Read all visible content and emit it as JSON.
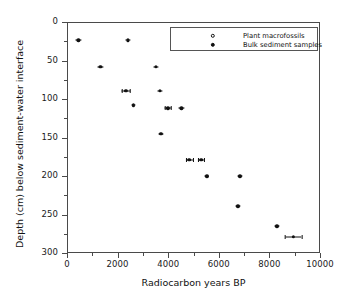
{
  "chart_data": {
    "type": "scatter",
    "title": "",
    "xlabel": "Radiocarbon years BP",
    "ylabel": "Depth (cm) below sediment-water interface",
    "xlim": [
      0,
      10000
    ],
    "ylim": [
      0,
      300
    ],
    "y_inverted": true,
    "grid": false,
    "legend_position": "top-right",
    "x_ticks": [
      0,
      2000,
      4000,
      6000,
      8000,
      10000
    ],
    "x_tick_labels": [
      "0",
      "2000",
      "4000",
      "6000",
      "8000",
      "10000"
    ],
    "x_minor_ticks": [
      1000,
      3000,
      5000,
      7000,
      9000
    ],
    "y_ticks": [
      0,
      50,
      100,
      150,
      200,
      250,
      300
    ],
    "y_tick_labels": [
      "0",
      "50",
      "100",
      "150",
      "200",
      "250",
      "300"
    ],
    "y_minor_ticks": [
      25,
      75,
      125,
      175,
      225,
      275
    ],
    "series": [
      {
        "name": "Plant macrofossils",
        "marker": "open-circle",
        "color": "#111111",
        "points": []
      },
      {
        "name": "Bulk sediment samples",
        "marker": "filled-circle",
        "color": "#111111",
        "points": [
          {
            "x": 450,
            "y": 24,
            "xerr": 110
          },
          {
            "x": 2400,
            "y": 24,
            "xerr": 110
          },
          {
            "x": 1320,
            "y": 58,
            "xerr": 110
          },
          {
            "x": 3520,
            "y": 58,
            "xerr": 110
          },
          {
            "x": 2320,
            "y": 89,
            "xerr": 170
          },
          {
            "x": 3680,
            "y": 89,
            "xerr": 110
          },
          {
            "x": 2620,
            "y": 108,
            "xerr": 90
          },
          {
            "x": 3980,
            "y": 112,
            "xerr": 130
          },
          {
            "x": 4520,
            "y": 112,
            "xerr": 110
          },
          {
            "x": 3720,
            "y": 145,
            "xerr": 90
          },
          {
            "x": 4840,
            "y": 179,
            "xerr": 120
          },
          {
            "x": 5300,
            "y": 179,
            "xerr": 120
          },
          {
            "x": 5520,
            "y": 200,
            "xerr": 90
          },
          {
            "x": 6840,
            "y": 200,
            "xerr": 90
          },
          {
            "x": 6760,
            "y": 239,
            "xerr": 90
          },
          {
            "x": 8300,
            "y": 265,
            "xerr": 90
          },
          {
            "x": 8950,
            "y": 279,
            "xerr": 330
          }
        ]
      }
    ]
  },
  "legend": {
    "entries": [
      {
        "label": "Plant macrofossils",
        "marker": "open-circle"
      },
      {
        "label": "Bulk sediment samples",
        "marker": "filled-circle"
      }
    ]
  },
  "axes": {
    "x_title": "Radiocarbon years BP",
    "y_title": "Depth (cm) below sediment-water interface"
  }
}
